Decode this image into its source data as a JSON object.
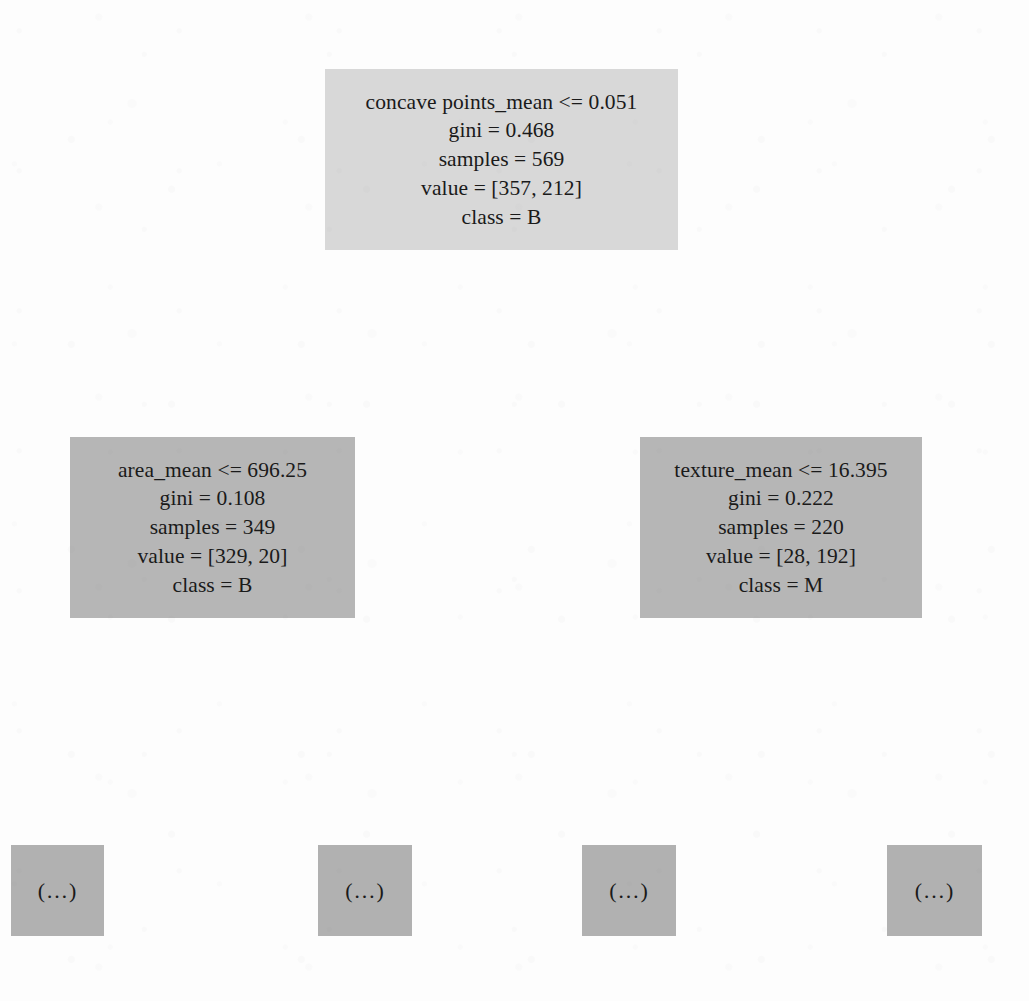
{
  "figure": {
    "kind": "decision-tree",
    "background_color": "#fdfdfd",
    "text_color": "#1a1a1a"
  },
  "tree": {
    "nodes": [
      {
        "id": "root",
        "role": "root",
        "fill": "#d8d8d8",
        "x": 325,
        "y": 69,
        "w": 353,
        "h": 181,
        "lines": [
          "concave points_mean <= 0.051",
          "gini = 0.468",
          "samples = 569",
          "value = [357, 212]",
          "class = B"
        ],
        "feature": "concave points_mean",
        "threshold": 0.051,
        "gini": 0.468,
        "samples": 569,
        "value": [
          357,
          212
        ],
        "predicted_class": "B"
      },
      {
        "id": "left-child",
        "role": "internal",
        "fill": "#b6b6b6",
        "x": 70,
        "y": 437,
        "w": 285,
        "h": 181,
        "lines": [
          "area_mean <= 696.25",
          "gini = 0.108",
          "samples = 349",
          "value = [329, 20]",
          "class = B"
        ],
        "feature": "area_mean",
        "threshold": 696.25,
        "gini": 0.108,
        "samples": 349,
        "value": [
          329,
          20
        ],
        "predicted_class": "B"
      },
      {
        "id": "right-child",
        "role": "internal",
        "fill": "#b6b6b6",
        "x": 640,
        "y": 437,
        "w": 282,
        "h": 181,
        "lines": [
          "texture_mean <= 16.395",
          "gini = 0.222",
          "samples = 220",
          "value = [28, 192]",
          "class = M"
        ],
        "feature": "texture_mean",
        "threshold": 16.395,
        "gini": 0.222,
        "samples": 220,
        "value": [
          28,
          192
        ],
        "predicted_class": "M"
      },
      {
        "id": "leaf-1",
        "role": "leaf",
        "fill": "#b1b1b1",
        "x": 11,
        "y": 845,
        "w": 93,
        "h": 91,
        "lines": [
          "(…)"
        ]
      },
      {
        "id": "leaf-2",
        "role": "leaf",
        "fill": "#b1b1b1",
        "x": 318,
        "y": 845,
        "w": 94,
        "h": 91,
        "lines": [
          "(…)"
        ]
      },
      {
        "id": "leaf-3",
        "role": "leaf",
        "fill": "#b1b1b1",
        "x": 582,
        "y": 845,
        "w": 94,
        "h": 91,
        "lines": [
          "(…)"
        ]
      },
      {
        "id": "leaf-4",
        "role": "leaf",
        "fill": "#b1b1b1",
        "x": 887,
        "y": 845,
        "w": 95,
        "h": 91,
        "lines": [
          "(…)"
        ]
      }
    ]
  }
}
